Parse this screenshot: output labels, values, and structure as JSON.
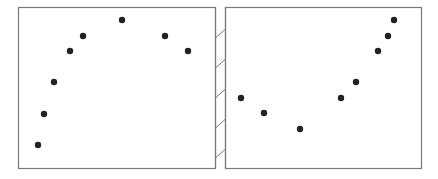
{
  "chart_data": {
    "type": "scatter",
    "title": "",
    "xlabel": "",
    "ylabel": "",
    "grid": false,
    "legend": null,
    "layout": "two side-by-side panels separated by a hatched axis-break strip",
    "colors": {
      "frame": "#7a7a7a",
      "point": "#222222",
      "background": "#ffffff"
    },
    "panels": [
      {
        "name": "left",
        "frame": {
          "x0": 18,
          "y0": 7,
          "x1": 215,
          "y1": 168
        },
        "points": [
          {
            "x": 38,
            "y": 145
          },
          {
            "x": 44,
            "y": 114
          },
          {
            "x": 54,
            "y": 82
          },
          {
            "x": 70,
            "y": 51
          },
          {
            "x": 83,
            "y": 36
          },
          {
            "x": 122,
            "y": 20
          },
          {
            "x": 165,
            "y": 36
          },
          {
            "x": 188,
            "y": 51
          }
        ]
      },
      {
        "name": "right",
        "frame": {
          "x0": 225,
          "y0": 7,
          "x1": 421,
          "y1": 168
        },
        "points": [
          {
            "x": 241,
            "y": 98
          },
          {
            "x": 264,
            "y": 113
          },
          {
            "x": 300,
            "y": 129
          },
          {
            "x": 341,
            "y": 98
          },
          {
            "x": 356,
            "y": 82
          },
          {
            "x": 378,
            "y": 51
          },
          {
            "x": 388,
            "y": 36
          },
          {
            "x": 394,
            "y": 20
          }
        ]
      }
    ],
    "break_strip": {
      "x0": 215,
      "x1": 225,
      "hatch_y": [
        38,
        68,
        98,
        128,
        158
      ],
      "hatch_height": 9
    }
  }
}
